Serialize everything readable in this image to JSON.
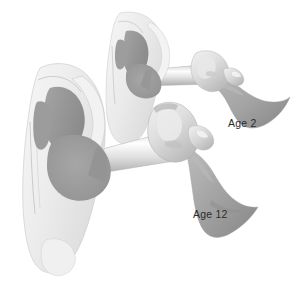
{
  "figure": {
    "background_color": "#ffffff",
    "width": 299,
    "height": 292
  },
  "palette": {
    "background": "#ffffff",
    "pinna_light": "#f1f1f1",
    "pinna_shade": "#e2e2e2",
    "pinna_edge": "#cfcfcf",
    "cartilage_outline": "#b9b9b9",
    "canal_dark": "#9a9a9a",
    "canal_mid": "#a8a8a8",
    "middle_ear_dark": "#8f8f8f",
    "tube_highlight": "#fdfdfd",
    "tube_body": "#d8d8d8",
    "tube_shadow": "#b5b5b5",
    "bone_light": "#ececec",
    "bone_shade": "#c2c2c2",
    "flare_gray": "#a9a9a9",
    "flare_shade": "#949494",
    "label_text": "#2b2b2b"
  },
  "specimens": [
    {
      "id": "age-2",
      "label": "Age 2",
      "label_x": 228,
      "label_y": 127,
      "description": "Smaller ear with a short, nearly horizontal eustachian tube",
      "tube_orientation": "horizontal",
      "scale": "small"
    },
    {
      "id": "age-12",
      "label": "Age 12",
      "label_x": 193,
      "label_y": 218,
      "description": "Larger ear with a longer, downward-angled eustachian tube",
      "tube_orientation": "angled-downward",
      "scale": "large"
    }
  ],
  "anatomy_parts": [
    {
      "name": "pinna",
      "display": "Auricle / pinna"
    },
    {
      "name": "ear-canal",
      "display": "External auditory canal"
    },
    {
      "name": "middle-ear",
      "display": "Middle ear cavity"
    },
    {
      "name": "ossicles",
      "display": "Ossicles / temporal bone"
    },
    {
      "name": "eustachian-tube",
      "display": "Eustachian tube"
    },
    {
      "name": "pharyngeal-opening",
      "display": "Pharyngeal opening (flare)"
    }
  ],
  "labels": {
    "age_2": "Age 2",
    "age_12": "Age 12"
  }
}
